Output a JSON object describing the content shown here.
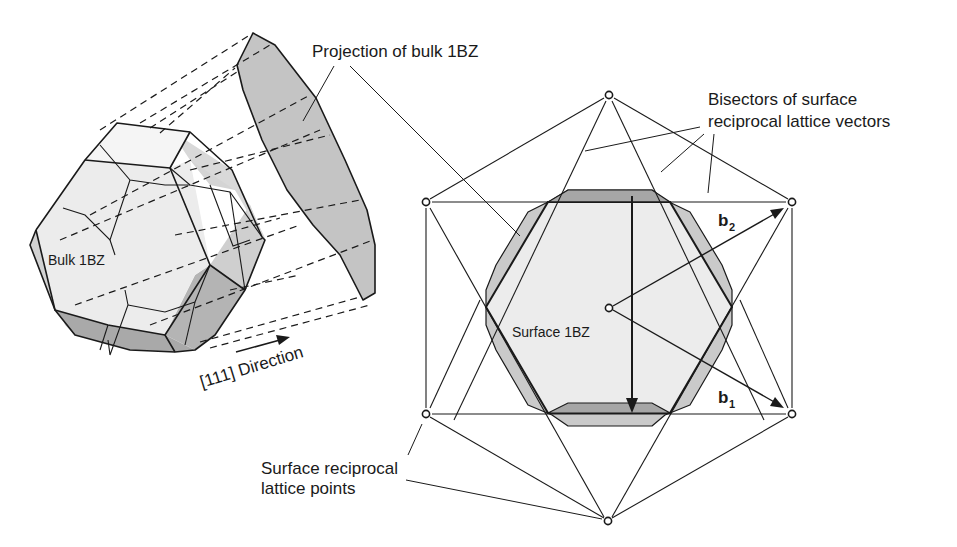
{
  "figure": {
    "labels": {
      "projection": "Projection of bulk 1BZ",
      "bulk": "Bulk 1BZ",
      "direction": "[111] Direction",
      "bisectors_line1": "Bisectors of surface",
      "bisectors_line2": "reciprocal lattice vectors",
      "surface_bz": "Surface 1BZ",
      "lattice_points_line1": "Surface reciprocal",
      "lattice_points_line2": "lattice points",
      "b1": "b",
      "b1_sub": "1",
      "b2": "b",
      "b2_sub": "2"
    },
    "colors": {
      "light_fill": "#e6e6e6",
      "mid_fill": "#c8c8c8",
      "dark_fill": "#a6a6a6",
      "line": "#1a1a1a"
    },
    "lattice_points": [
      {
        "x": 609,
        "y": 95
      },
      {
        "x": 426,
        "y": 202
      },
      {
        "x": 792,
        "y": 202
      },
      {
        "x": 609,
        "y": 308
      },
      {
        "x": 426,
        "y": 414
      },
      {
        "x": 792,
        "y": 414
      },
      {
        "x": 608,
        "y": 521
      }
    ]
  }
}
